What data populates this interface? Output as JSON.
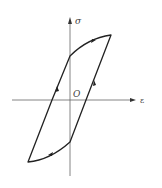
{
  "diagram": {
    "type": "hysteresis-loop",
    "axes": {
      "x_label": "ε",
      "y_label": "σ",
      "origin_label": "O"
    },
    "colors": {
      "axis": "#555555",
      "curve": "#222222",
      "background": "#ffffff"
    }
  }
}
